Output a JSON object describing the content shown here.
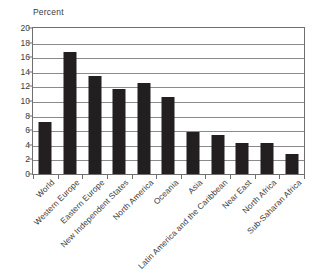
{
  "chart_data": {
    "type": "bar",
    "title": "",
    "xlabel": "",
    "ylabel": "Percent",
    "ylim": [
      0,
      20
    ],
    "ytick_step": 2,
    "grid": true,
    "legend": false,
    "bar_color": "#231f20",
    "axis_color": "#6f6f6f",
    "text_color": "#3b3b3b",
    "categories": [
      "World",
      "Western Europe",
      "Eastern Europe",
      "New Independent States",
      "North America",
      "Oceania",
      "Asia",
      "Latin America and the Caribbean",
      "Near East",
      "North Africa",
      "Sub-Saharan Africa"
    ],
    "values": [
      7.1,
      16.7,
      13.4,
      11.7,
      12.4,
      10.5,
      5.8,
      5.3,
      4.3,
      4.2,
      2.8
    ],
    "ytick_labels": [
      "0",
      "2",
      "4",
      "6",
      "8",
      "10",
      "12",
      "14",
      "16",
      "18",
      "20"
    ],
    "ytick_values": [
      0,
      2,
      4,
      6,
      8,
      10,
      12,
      14,
      16,
      18,
      20
    ]
  }
}
